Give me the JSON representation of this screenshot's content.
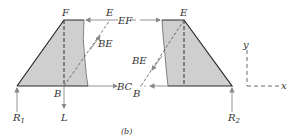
{
  "caption": "(b)",
  "labels": {
    "F": "F",
    "E_left": "E",
    "EF": "EF",
    "BE_left": "BE",
    "B_left": "B",
    "BC": "BC",
    "L": "L",
    "R1": "R",
    "R1_sub": "1",
    "E_right": "E",
    "BE_right": "BE",
    "B_right": "B",
    "R2": "R",
    "R2_sub": "2",
    "axis_x": "x",
    "axis_y": "y"
  },
  "colors": {
    "fill": "#cfcfcf",
    "stroke": "#2a2a2a",
    "arrow": "#888888"
  }
}
